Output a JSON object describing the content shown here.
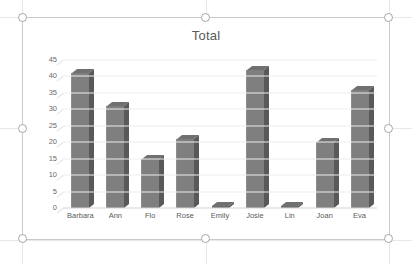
{
  "window": {
    "app": "spreadsheet-chart",
    "selection_state": "selected"
  },
  "selection": {
    "handles": [
      "top-left",
      "top-center",
      "top-right",
      "middle-left",
      "middle-right",
      "bottom-left",
      "bottom-center",
      "bottom-right"
    ]
  },
  "chart_data": {
    "type": "bar",
    "title": "Total",
    "xlabel": "",
    "ylabel": "",
    "categories": [
      "Barbara",
      "Ann",
      "Flo",
      "Rose",
      "Emily",
      "Josie",
      "Lin",
      "Joan",
      "Eva"
    ],
    "values": [
      41,
      31,
      15,
      21,
      0,
      42,
      0,
      20,
      36
    ],
    "yticks": [
      0,
      5,
      10,
      15,
      20,
      25,
      30,
      35,
      40,
      45
    ],
    "ylim": [
      0,
      45
    ],
    "grid": true,
    "legend": false,
    "legend_position": "none",
    "style": "3-D column",
    "series_color": "#7f7f7f",
    "series_side_color": "#595959",
    "gridline_color": "#ededed",
    "title_color": "#595959",
    "tick_color": "#6b6b6b"
  }
}
